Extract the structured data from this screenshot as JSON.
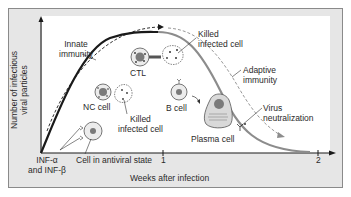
{
  "diagram": {
    "y_axis_label": [
      "Number of infectious",
      "viral particles"
    ],
    "x_axis_label": "Weeks after infection",
    "x_ticks": [
      "1",
      "2"
    ],
    "curve_labels": {
      "innate": [
        "Innate",
        "immunity"
      ],
      "adaptive": [
        "Adaptive",
        "immunity"
      ]
    },
    "cells": {
      "ctl": "CTL",
      "nc": "NC cell",
      "b": "B cell",
      "plasma": "Plasma cell",
      "killed_top": [
        "Killed",
        "infected cell"
      ],
      "killed_bottom": [
        "Killed",
        "infected cell"
      ],
      "antiviral": "Cell in antiviral state"
    },
    "annotations": {
      "interferon": [
        "INF-α",
        "and INF-β"
      ],
      "virus_neutralization": [
        "Virus",
        "neutralization"
      ]
    },
    "colors": {
      "innate_curve": "#1a1a1a",
      "adaptive_curve": "#8c8c8c",
      "frame_bg": "#e6e6e6",
      "cell_fill": "#ececec",
      "nucleus": "#7a7a7a",
      "plasma_fill": "#d9d9d9"
    }
  }
}
